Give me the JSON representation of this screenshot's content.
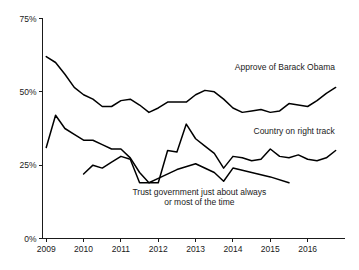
{
  "chart_data": {
    "type": "line",
    "title": "",
    "subtitle": "",
    "xlabel": "",
    "ylabel": "",
    "xlim": [
      2008.9,
      2017.0
    ],
    "ylim": [
      0,
      75
    ],
    "grid": false,
    "legend_position": "inline-annotations",
    "y_ticks": [
      {
        "value": 75,
        "label": "75%"
      },
      {
        "value": 50,
        "label": "50%"
      },
      {
        "value": 25,
        "label": "25%"
      },
      {
        "value": 0,
        "label": "0%"
      }
    ],
    "x_ticks": [
      {
        "value": 2009,
        "label": "2009"
      },
      {
        "value": 2010,
        "label": "2010"
      },
      {
        "value": 2011,
        "label": "2011"
      },
      {
        "value": 2012,
        "label": "2012"
      },
      {
        "value": 2013,
        "label": "2013"
      },
      {
        "value": 2014,
        "label": "2014"
      },
      {
        "value": 2015,
        "label": "2015"
      },
      {
        "value": 2016,
        "label": "2016"
      }
    ],
    "series": [
      {
        "name": "Approve of Barack Obama",
        "color": "#000000",
        "label_lines": [
          "Approve of Barack Obama"
        ],
        "label_x": 2014.05,
        "label_y": 57.5,
        "label_anchor": "start",
        "x": [
          2009.0,
          2009.25,
          2009.5,
          2009.75,
          2010.0,
          2010.25,
          2010.5,
          2010.75,
          2011.0,
          2011.25,
          2011.5,
          2011.75,
          2012.0,
          2012.25,
          2012.5,
          2012.75,
          2013.0,
          2013.25,
          2013.5,
          2013.75,
          2014.0,
          2014.25,
          2014.5,
          2014.75,
          2015.0,
          2015.25,
          2015.5,
          2015.75,
          2016.0,
          2016.25,
          2016.5,
          2016.75
        ],
        "values": [
          62.0,
          60.0,
          56.0,
          51.5,
          49.0,
          47.5,
          45.0,
          45.0,
          47.0,
          47.5,
          45.5,
          43.0,
          44.5,
          46.5,
          46.5,
          46.5,
          49.0,
          50.5,
          50.0,
          47.5,
          44.5,
          43.0,
          43.5,
          44.0,
          43.0,
          43.5,
          46.0,
          45.5,
          45.0,
          47.0,
          49.5,
          51.5
        ]
      },
      {
        "name": "Country on right track",
        "color": "#000000",
        "label_lines": [
          "Country on right track"
        ],
        "label_x": 2014.55,
        "label_y": 35.5,
        "label_anchor": "start",
        "x": [
          2009.0,
          2009.25,
          2009.5,
          2009.75,
          2010.0,
          2010.25,
          2010.5,
          2010.75,
          2011.0,
          2011.25,
          2011.5,
          2011.75,
          2012.0,
          2012.25,
          2012.5,
          2012.75,
          2013.0,
          2013.25,
          2013.5,
          2013.75,
          2014.0,
          2014.25,
          2014.5,
          2014.75,
          2015.0,
          2015.25,
          2015.5,
          2015.75,
          2016.0,
          2016.25,
          2016.5,
          2016.75
        ],
        "values": [
          31.0,
          42.0,
          37.5,
          35.5,
          33.5,
          33.5,
          32.0,
          30.5,
          30.5,
          27.5,
          22.5,
          19.0,
          19.0,
          30.0,
          29.5,
          39.0,
          34.0,
          31.5,
          29.0,
          24.0,
          28.0,
          27.5,
          26.5,
          27.0,
          30.5,
          28.0,
          27.5,
          28.5,
          27.0,
          26.5,
          27.5,
          30.0
        ]
      },
      {
        "name": "Trust government just about always or most of the time",
        "color": "#000000",
        "label_lines": [
          "Trust government just about always",
          "or most of the time"
        ],
        "label_x": 2013.1,
        "label_y": 15.0,
        "label_anchor": "middle",
        "x": [
          2010.0,
          2010.25,
          2010.5,
          2010.75,
          2011.0,
          2011.25,
          2011.5,
          2011.75,
          2012.0,
          2012.5,
          2013.0,
          2013.5,
          2013.75,
          2014.0,
          2014.5,
          2015.0,
          2015.5
        ],
        "values": [
          22.0,
          25.0,
          24.0,
          26.0,
          28.0,
          27.0,
          19.0,
          19.0,
          20.5,
          23.5,
          25.5,
          22.5,
          19.5,
          24.0,
          22.5,
          21.0,
          19.0
        ]
      }
    ]
  }
}
